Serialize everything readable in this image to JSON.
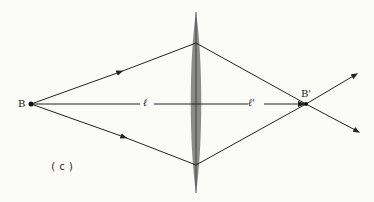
{
  "diagram": {
    "type": "optics-ray-diagram",
    "labels": {
      "object_point": "B",
      "image_point": "B'",
      "object_distance": "ℓ",
      "image_distance": "ℓ'",
      "caption": "(c)"
    },
    "colors": {
      "background": "#fbfbf8",
      "lens_fill": "#8a8a8a",
      "line": "#222222"
    },
    "elements": {
      "lens": {
        "type": "converging",
        "center_x": 196,
        "top_y": 12,
        "bottom_y": 193
      },
      "object": {
        "x": 31,
        "y": 104
      },
      "image": {
        "x": 306,
        "y": 104
      }
    }
  }
}
